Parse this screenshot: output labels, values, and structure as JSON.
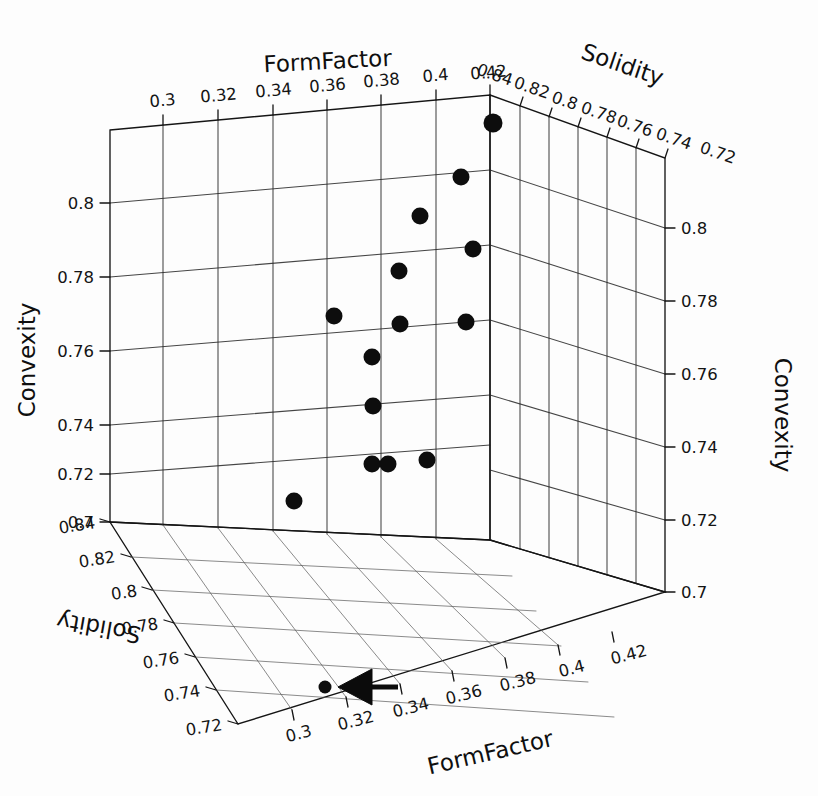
{
  "figure": {
    "type": "scatter3d",
    "background_color": "#fdfdfd",
    "marker_color": "#0d0d0d",
    "grid_color": "#2b2b2b",
    "annotation": {
      "name": "left-pointing-arrow",
      "points_to": "floor-projection-point",
      "color": "#0b0b0b"
    }
  },
  "axis_titles": {
    "form_factor_top": "FormFactor",
    "form_factor_bottom": "FormFactor",
    "solidity_top": "Solidity",
    "solidity_left": "Solidity",
    "convexity_left": "Convexity",
    "convexity_right": "Convexity"
  },
  "axes": {
    "form_factor_top": {
      "label": "FormFactor",
      "ticks": [
        "0.3",
        "0.32",
        "0.34",
        "0.36",
        "0.38",
        "0.4",
        "0.42"
      ],
      "range": [
        0.29,
        0.43
      ]
    },
    "form_factor_bottom": {
      "label": "FormFactor",
      "ticks": [
        "0.3",
        "0.32",
        "0.34",
        "0.36",
        "0.38",
        "0.4",
        "0.42"
      ],
      "range": [
        0.29,
        0.43
      ]
    },
    "solidity_top": {
      "label": "Solidity",
      "ticks": [
        "0.84",
        "0.82",
        "0.8",
        "0.78",
        "0.76",
        "0.74",
        "0.72"
      ],
      "range": [
        0.85,
        0.71
      ]
    },
    "solidity_left": {
      "label": "Solidity",
      "ticks": [
        "0.84",
        "0.82",
        "0.8",
        "0.78",
        "0.76",
        "0.74",
        "0.72"
      ],
      "range": [
        0.85,
        0.71
      ]
    },
    "convexity_left": {
      "label": "Convexity",
      "ticks": [
        "0.8",
        "0.78",
        "0.76",
        "0.74",
        "0.72",
        "0.7"
      ],
      "range": [
        0.81,
        0.69
      ]
    },
    "convexity_right": {
      "label": "Convexity",
      "ticks": [
        "0.8",
        "0.78",
        "0.76",
        "0.74",
        "0.72",
        "0.7"
      ],
      "range": [
        0.81,
        0.69
      ]
    }
  },
  "chart_data": {
    "type": "scatter",
    "title": "",
    "xlabel": "FormFactor",
    "ylabel": "Solidity",
    "zlabel": "Convexity",
    "xlim": [
      0.29,
      0.43
    ],
    "ylim": [
      0.71,
      0.85
    ],
    "zlim": [
      0.69,
      0.81
    ],
    "grid": true,
    "legend": null,
    "projection": "3d",
    "xticks": [
      0.3,
      0.32,
      0.34,
      0.36,
      0.38,
      0.4,
      0.42
    ],
    "yticks": [
      0.72,
      0.74,
      0.76,
      0.78,
      0.8,
      0.82,
      0.84
    ],
    "zticks": [
      0.7,
      0.72,
      0.74,
      0.76,
      0.78,
      0.8
    ],
    "series": [
      {
        "name": "samples",
        "marker": "filled-circle",
        "color": "#0d0d0d",
        "points": [
          {
            "x": 0.406,
            "y": 0.838,
            "z": 0.807,
            "px": 493,
            "py": 123,
            "r": 9.5
          },
          {
            "x": 0.401,
            "y": 0.835,
            "z": 0.79,
            "px": 461,
            "py": 177,
            "r": 8.5
          },
          {
            "x": 0.395,
            "y": 0.84,
            "z": 0.781,
            "px": 420,
            "py": 216,
            "r": 8.5
          },
          {
            "x": 0.404,
            "y": 0.826,
            "z": 0.774,
            "px": 473,
            "py": 249,
            "r": 8.5
          },
          {
            "x": 0.388,
            "y": 0.838,
            "z": 0.769,
            "px": 399,
            "py": 271,
            "r": 8.5
          },
          {
            "x": 0.366,
            "y": 0.842,
            "z": 0.76,
            "px": 334,
            "py": 316,
            "r": 8.5
          },
          {
            "x": 0.403,
            "y": 0.822,
            "z": 0.757,
            "px": 466,
            "py": 322,
            "r": 8.5
          },
          {
            "x": 0.389,
            "y": 0.832,
            "z": 0.758,
            "px": 400,
            "py": 324,
            "r": 8.5
          },
          {
            "x": 0.379,
            "y": 0.836,
            "z": 0.751,
            "px": 372,
            "py": 357,
            "r": 8.5
          },
          {
            "x": 0.379,
            "y": 0.834,
            "z": 0.739,
            "px": 373,
            "py": 406,
            "r": 8.5
          },
          {
            "x": 0.379,
            "y": 0.833,
            "z": 0.722,
            "px": 372,
            "py": 464,
            "r": 8.5
          },
          {
            "x": 0.384,
            "y": 0.83,
            "z": 0.722,
            "px": 388,
            "py": 464,
            "r": 8.5
          },
          {
            "x": 0.396,
            "y": 0.824,
            "z": 0.722,
            "px": 427,
            "py": 460,
            "r": 8.5
          },
          {
            "x": 0.353,
            "y": 0.841,
            "z": 0.711,
            "px": 294,
            "py": 501,
            "r": 8.5
          },
          {
            "x": 0.311,
            "y": 0.744,
            "z": 0.69,
            "px": 325,
            "py": 687,
            "r": 6.5
          }
        ]
      }
    ]
  }
}
